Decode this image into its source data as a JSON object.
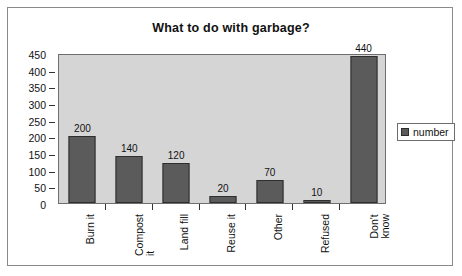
{
  "chart_data": {
    "type": "bar",
    "title": "What to do with garbage?",
    "xlabel": "",
    "ylabel": "",
    "categories": [
      "Burn it",
      "Compost it",
      "Land fill",
      "Reuse it",
      "Other",
      "Refused",
      "Don't know"
    ],
    "category_lines": [
      [
        "Burn it"
      ],
      [
        "Compost",
        "it"
      ],
      [
        "Land fill"
      ],
      [
        "Reuse it"
      ],
      [
        "Other"
      ],
      [
        "Refused"
      ],
      [
        "Don't",
        "know"
      ]
    ],
    "values": [
      200,
      140,
      120,
      20,
      70,
      10,
      440
    ],
    "data_labels": [
      "200",
      "140",
      "120",
      "20",
      "70",
      "10",
      "440"
    ],
    "series": [
      {
        "name": "number",
        "values": [
          200,
          140,
          120,
          20,
          70,
          10,
          440
        ]
      }
    ],
    "ylim": [
      0,
      450
    ],
    "y_ticks": [
      0,
      50,
      100,
      150,
      200,
      250,
      300,
      350,
      400,
      450
    ],
    "y_tick_labels": [
      "0",
      "50",
      "100",
      "150",
      "200",
      "250",
      "300",
      "350",
      "400",
      "450"
    ],
    "grid": false,
    "legend": {
      "position": "right",
      "entries": [
        {
          "label": "number",
          "color": "#5b5b5b"
        }
      ]
    },
    "colors": {
      "bar_fill": "#5b5b5b",
      "bar_border": "#2e2e2e",
      "plot_background": "#d5d5d5",
      "frame_border": "#8a8a8a",
      "text": "#111111"
    }
  }
}
